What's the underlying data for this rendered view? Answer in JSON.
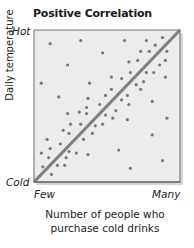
{
  "chart_data": {
    "type": "scatter",
    "title": "Positive Correlation",
    "xlabel": "Number of people who purchase cold drinks",
    "ylabel": "Daily temperature",
    "x_tick_labels": [
      "Few",
      "Many"
    ],
    "y_tick_labels": [
      "Cold",
      "Hot"
    ],
    "xlim": [
      0,
      100
    ],
    "ylim": [
      0,
      100
    ],
    "grid": false,
    "legend": null,
    "trend_line": {
      "from": [
        0,
        0
      ],
      "to": [
        100,
        100
      ],
      "color": "#808080",
      "label": "positive trend"
    },
    "points": [
      {
        "x": 11,
        "y": 91
      },
      {
        "x": 32,
        "y": 93
      },
      {
        "x": 47,
        "y": 85
      },
      {
        "x": 23,
        "y": 77
      },
      {
        "x": 5,
        "y": 65
      },
      {
        "x": 38,
        "y": 65
      },
      {
        "x": 17,
        "y": 56
      },
      {
        "x": 37,
        "y": 55
      },
      {
        "x": 49,
        "y": 57
      },
      {
        "x": 45,
        "y": 51
      },
      {
        "x": 62,
        "y": 93
      },
      {
        "x": 77,
        "y": 93
      },
      {
        "x": 83,
        "y": 90
      },
      {
        "x": 88,
        "y": 95
      },
      {
        "x": 73,
        "y": 86
      },
      {
        "x": 79,
        "y": 86
      },
      {
        "x": 91,
        "y": 86
      },
      {
        "x": 65,
        "y": 79
      },
      {
        "x": 71,
        "y": 80
      },
      {
        "x": 86,
        "y": 77
      },
      {
        "x": 90,
        "y": 80
      },
      {
        "x": 66,
        "y": 72
      },
      {
        "x": 77,
        "y": 72
      },
      {
        "x": 82,
        "y": 72
      },
      {
        "x": 90,
        "y": 69
      },
      {
        "x": 53,
        "y": 69
      },
      {
        "x": 60,
        "y": 68
      },
      {
        "x": 70,
        "y": 64
      },
      {
        "x": 75,
        "y": 66
      },
      {
        "x": 53,
        "y": 61
      },
      {
        "x": 73,
        "y": 61
      },
      {
        "x": 64,
        "y": 57
      },
      {
        "x": 60,
        "y": 54
      },
      {
        "x": 81,
        "y": 53
      },
      {
        "x": 23,
        "y": 45
      },
      {
        "x": 31,
        "y": 46
      },
      {
        "x": 36,
        "y": 49
      },
      {
        "x": 36,
        "y": 45
      },
      {
        "x": 49,
        "y": 44
      },
      {
        "x": 25,
        "y": 38
      },
      {
        "x": 32,
        "y": 38
      },
      {
        "x": 42,
        "y": 37
      },
      {
        "x": 47,
        "y": 38
      },
      {
        "x": 20,
        "y": 34
      },
      {
        "x": 24,
        "y": 32
      },
      {
        "x": 40,
        "y": 32
      },
      {
        "x": 9,
        "y": 28
      },
      {
        "x": 34,
        "y": 28
      },
      {
        "x": 18,
        "y": 25
      },
      {
        "x": 11,
        "y": 22
      },
      {
        "x": 5,
        "y": 19
      },
      {
        "x": 10,
        "y": 16
      },
      {
        "x": 24,
        "y": 20
      },
      {
        "x": 29,
        "y": 19
      },
      {
        "x": 37,
        "y": 18
      },
      {
        "x": 22,
        "y": 16
      },
      {
        "x": 6,
        "y": 10
      },
      {
        "x": 16,
        "y": 11
      },
      {
        "x": 21,
        "y": 11
      },
      {
        "x": 12,
        "y": 5
      },
      {
        "x": 56,
        "y": 47
      },
      {
        "x": 65,
        "y": 51
      },
      {
        "x": 54,
        "y": 42
      },
      {
        "x": 64,
        "y": 41
      },
      {
        "x": 91,
        "y": 42
      },
      {
        "x": 81,
        "y": 31
      },
      {
        "x": 58,
        "y": 21
      },
      {
        "x": 88,
        "y": 14
      },
      {
        "x": 66,
        "y": 9
      }
    ]
  },
  "colors": {
    "plot_background": "#ececec",
    "plot_border": "#6e6e6e",
    "shadow": "#d4d4d4",
    "point": "#7a7a7a",
    "trend_line": "#808080"
  }
}
